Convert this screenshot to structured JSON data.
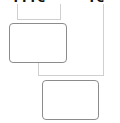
{
  "diagram": {
    "header_left_text": "ᴛᴛᴛᴄ",
    "header_right_text": "ᴛᴄ",
    "nodes": [
      {
        "id": "box-1",
        "label": ""
      },
      {
        "id": "box-2",
        "label": ""
      }
    ],
    "colors": {
      "node_border": "#8c8c8c",
      "connector": "#cfcfcf",
      "text": "#111111",
      "background": "#ffffff"
    }
  }
}
